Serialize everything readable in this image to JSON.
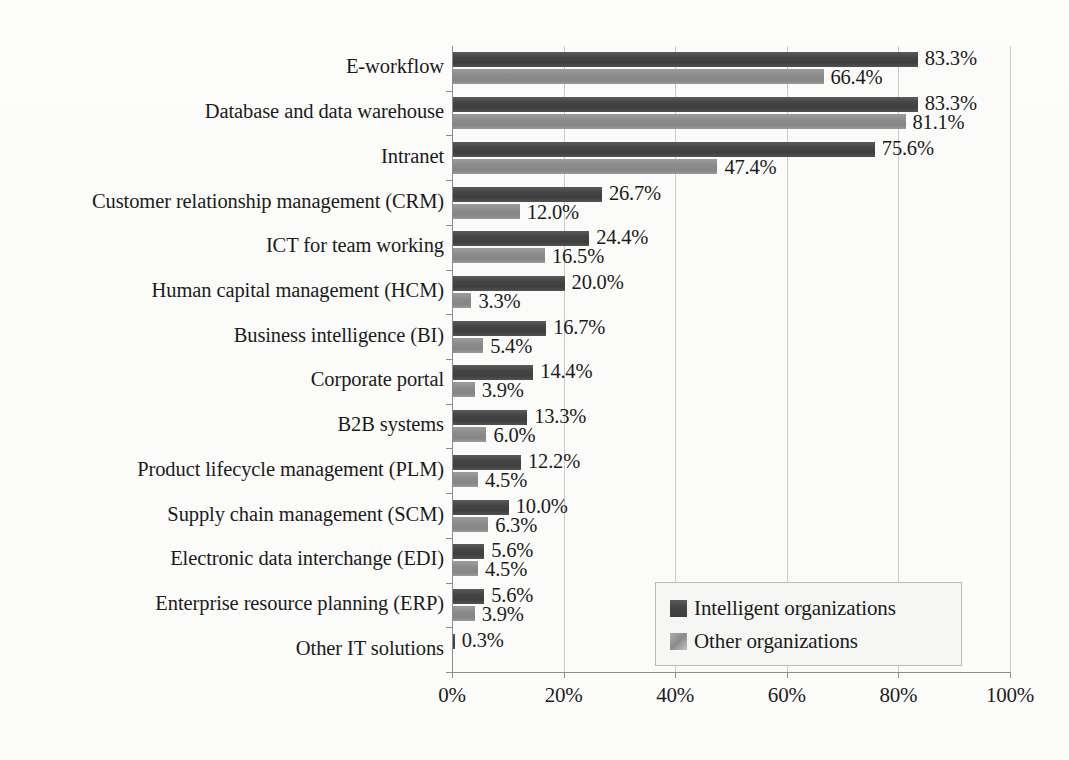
{
  "chart_data": {
    "type": "bar",
    "orientation": "horizontal",
    "title": "",
    "xlabel": "",
    "ylabel": "",
    "xlim": [
      0,
      100
    ],
    "grid": true,
    "legend_position": "bottom-right",
    "x_tick_labels": [
      "0%",
      "20%",
      "40%",
      "60%",
      "80%",
      "100%"
    ],
    "x_ticks": [
      0,
      20,
      40,
      60,
      80,
      100
    ],
    "categories": [
      "E-workflow",
      "Database and data warehouse",
      "Intranet",
      "Customer relationship management (CRM)",
      "ICT for team working",
      "Human capital management (HCM)",
      "Business intelligence (BI)",
      "Corporate portal",
      "B2B systems",
      "Product lifecycle management (PLM)",
      "Supply chain management (SCM)",
      "Electronic data interchange (EDI)",
      "Enterprise resource planning (ERP)",
      "Other IT solutions"
    ],
    "series": [
      {
        "name": "Intelligent organizations",
        "color": "#454545",
        "values": [
          83.3,
          83.3,
          75.6,
          26.7,
          24.4,
          20.0,
          16.7,
          14.4,
          13.3,
          12.2,
          10.0,
          5.6,
          5.6,
          0.3
        ],
        "labels": [
          "83.3%",
          "83.3%",
          "75.6%",
          "26.7%",
          "24.4%",
          "20.0%",
          "16.7%",
          "14.4%",
          "13.3%",
          "12.2%",
          "10.0%",
          "5.6%",
          "5.6%",
          "0.3%"
        ]
      },
      {
        "name": "Other organizations",
        "color": "#8b8b8b",
        "values": [
          66.4,
          81.1,
          47.4,
          12.0,
          16.5,
          3.3,
          5.4,
          3.9,
          6.0,
          4.5,
          6.3,
          4.5,
          3.9,
          null
        ],
        "labels": [
          "66.4%",
          "81.1%",
          "47.4%",
          "12.0%",
          "16.5%",
          "3.3%",
          "5.4%",
          "3.9%",
          "6.0%",
          "4.5%",
          "6.3%",
          "4.5%",
          "3.9%",
          ""
        ]
      }
    ]
  },
  "legend": {
    "items": [
      {
        "label": "Intelligent organizations"
      },
      {
        "label": "Other organizations"
      }
    ]
  }
}
